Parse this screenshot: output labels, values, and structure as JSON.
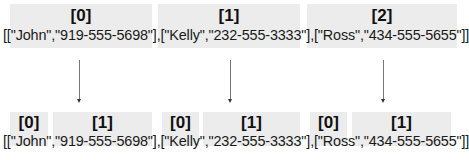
{
  "top": {
    "indices": [
      "[0]",
      "[1]",
      "[2]"
    ],
    "array_text": "[[\"John\",\"919-555-5698\"],[\"Kelly\",\"232-555-3333\"],[\"Ross\",\"434-555-5655\"]]"
  },
  "bottom": {
    "groups": [
      {
        "inner_indices": [
          "[0]",
          "[1]"
        ]
      },
      {
        "inner_indices": [
          "[0]",
          "[1]"
        ]
      },
      {
        "inner_indices": [
          "[0]",
          "[1]"
        ]
      }
    ],
    "array_text": "[[\"John\",\"919-555-5698\"],[\"Kelly\",\"232-555-3333\"],[\"Ross\",\"434-555-5655\"]]"
  },
  "entries": [
    {
      "name": "John",
      "phone": "919-555-5698"
    },
    {
      "name": "Kelly",
      "phone": "232-555-3333"
    },
    {
      "name": "Ross",
      "phone": "434-555-5655"
    }
  ],
  "colors": {
    "box_fill": "#ececec",
    "arrow": "#777777",
    "text": "#1a1a1a"
  }
}
